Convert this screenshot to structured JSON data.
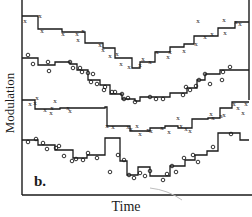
{
  "figure": {
    "panel_label": "b.",
    "xlabel": "Time",
    "ylabel": "Modulation"
  },
  "colors": {
    "ink": "#1a1a1a",
    "background": "#ffffff",
    "stray_mark": "#bdbdbd"
  },
  "chart_data": {
    "type": "line",
    "subtype": "step",
    "title": "",
    "panel": "b.",
    "xlabel": "Time",
    "ylabel": "Modulation",
    "grid": false,
    "legend": null,
    "ticks": "none labeled",
    "units": "pixel coordinates (arbitrary, no numeric axis labels shown)",
    "series": [
      {
        "name": "trace-1",
        "marker": "x",
        "step_points": [
          [
            22,
            16
          ],
          [
            38,
            16
          ],
          [
            38,
            29
          ],
          [
            62,
            29
          ],
          [
            62,
            32
          ],
          [
            85,
            32
          ],
          [
            85,
            43
          ],
          [
            103,
            43
          ],
          [
            103,
            48
          ],
          [
            115,
            48
          ],
          [
            115,
            58
          ],
          [
            132,
            58
          ],
          [
            132,
            68
          ],
          [
            140,
            68
          ],
          [
            140,
            62
          ],
          [
            155,
            62
          ],
          [
            155,
            52
          ],
          [
            170,
            52
          ],
          [
            170,
            47
          ],
          [
            184,
            47
          ],
          [
            184,
            44
          ],
          [
            194,
            44
          ],
          [
            194,
            36
          ],
          [
            218,
            36
          ],
          [
            218,
            28
          ],
          [
            235,
            28
          ],
          [
            235,
            22
          ],
          [
            249,
            22
          ]
        ],
        "markers": [
          [
            25,
            20
          ],
          [
            40,
            15
          ],
          [
            42,
            30
          ],
          [
            63,
            33
          ],
          [
            77,
            33
          ],
          [
            78,
            39
          ],
          [
            83,
            30
          ],
          [
            100,
            44
          ],
          [
            103,
            49
          ],
          [
            110,
            55
          ],
          [
            117,
            53
          ],
          [
            121,
            63
          ],
          [
            129,
            66
          ],
          [
            140,
            64
          ],
          [
            143,
            58
          ],
          [
            150,
            61
          ],
          [
            157,
            51
          ],
          [
            170,
            51
          ],
          [
            168,
            56
          ],
          [
            184,
            50
          ],
          [
            196,
            43
          ],
          [
            198,
            20
          ],
          [
            205,
            36
          ],
          [
            212,
            33
          ],
          [
            225,
            32
          ],
          [
            224,
            19
          ],
          [
            236,
            21
          ],
          [
            240,
            23
          ]
        ]
      },
      {
        "name": "trace-2",
        "marker": "o",
        "step_points": [
          [
            22,
            58
          ],
          [
            38,
            58
          ],
          [
            38,
            65
          ],
          [
            55,
            65
          ],
          [
            55,
            62
          ],
          [
            70,
            62
          ],
          [
            70,
            64
          ],
          [
            77,
            64
          ],
          [
            77,
            70
          ],
          [
            88,
            70
          ],
          [
            88,
            80
          ],
          [
            100,
            80
          ],
          [
            100,
            85
          ],
          [
            110,
            85
          ],
          [
            110,
            94
          ],
          [
            122,
            94
          ],
          [
            122,
            99
          ],
          [
            135,
            99
          ],
          [
            135,
            101
          ],
          [
            140,
            101
          ],
          [
            140,
            97
          ],
          [
            170,
            97
          ],
          [
            170,
            93
          ],
          [
            187,
            93
          ],
          [
            187,
            88
          ],
          [
            197,
            88
          ],
          [
            197,
            80
          ],
          [
            205,
            80
          ],
          [
            205,
            74
          ],
          [
            220,
            74
          ],
          [
            220,
            70
          ],
          [
            249,
            70
          ]
        ],
        "markers": [
          [
            28,
            55
          ],
          [
            33,
            64
          ],
          [
            48,
            62
          ],
          [
            49,
            71
          ],
          [
            70,
            62
          ],
          [
            73,
            68
          ],
          [
            80,
            68
          ],
          [
            82,
            72
          ],
          [
            88,
            73
          ],
          [
            93,
            74
          ],
          [
            91,
            82
          ],
          [
            97,
            84
          ],
          [
            104,
            90
          ],
          [
            105,
            87
          ],
          [
            112,
            92
          ],
          [
            115,
            92
          ],
          [
            122,
            94
          ],
          [
            124,
            99
          ],
          [
            128,
            98
          ],
          [
            135,
            102
          ],
          [
            150,
            97
          ],
          [
            156,
            99
          ],
          [
            163,
            99
          ],
          [
            183,
            95
          ],
          [
            186,
            87
          ],
          [
            190,
            90
          ],
          [
            196,
            86
          ],
          [
            199,
            80
          ],
          [
            205,
            74
          ],
          [
            210,
            84
          ],
          [
            222,
            80
          ],
          [
            223,
            72
          ],
          [
            230,
            67
          ]
        ]
      },
      {
        "name": "trace-3",
        "marker": "x",
        "step_points": [
          [
            22,
            100
          ],
          [
            35,
            100
          ],
          [
            35,
            109
          ],
          [
            60,
            109
          ],
          [
            60,
            108
          ],
          [
            105,
            108
          ],
          [
            105,
            107
          ],
          [
            107,
            107
          ],
          [
            107,
            126
          ],
          [
            130,
            126
          ],
          [
            130,
            131
          ],
          [
            150,
            131
          ],
          [
            150,
            128
          ],
          [
            165,
            128
          ],
          [
            165,
            126
          ],
          [
            178,
            126
          ],
          [
            178,
            128
          ],
          [
            192,
            128
          ],
          [
            192,
            119
          ],
          [
            208,
            119
          ],
          [
            208,
            118
          ],
          [
            220,
            118
          ],
          [
            220,
            108
          ],
          [
            232,
            108
          ],
          [
            232,
            102
          ],
          [
            249,
            102
          ]
        ],
        "markers": [
          [
            30,
            103
          ],
          [
            35,
            102
          ],
          [
            37,
            97
          ],
          [
            45,
            109
          ],
          [
            51,
            112
          ],
          [
            52,
            107
          ],
          [
            55,
            100
          ],
          [
            68,
            107
          ],
          [
            70,
            110
          ],
          [
            107,
            125
          ],
          [
            113,
            126
          ],
          [
            128,
            126
          ],
          [
            131,
            128
          ],
          [
            137,
            125
          ],
          [
            140,
            133
          ],
          [
            148,
            129
          ],
          [
            151,
            130
          ],
          [
            162,
            127
          ],
          [
            169,
            131
          ],
          [
            178,
            117
          ],
          [
            181,
            125
          ],
          [
            186,
            128
          ],
          [
            190,
            130
          ],
          [
            211,
            113
          ],
          [
            213,
            117
          ],
          [
            221,
            115
          ],
          [
            224,
            114
          ],
          [
            234,
            103
          ],
          [
            238,
            107
          ],
          [
            243,
            112
          ],
          [
            246,
            103
          ]
        ]
      },
      {
        "name": "trace-4",
        "marker": "o",
        "step_points": [
          [
            22,
            140
          ],
          [
            38,
            140
          ],
          [
            38,
            145
          ],
          [
            55,
            145
          ],
          [
            55,
            150
          ],
          [
            73,
            150
          ],
          [
            73,
            158
          ],
          [
            87,
            158
          ],
          [
            87,
            155
          ],
          [
            105,
            155
          ],
          [
            105,
            138
          ],
          [
            120,
            138
          ],
          [
            120,
            161
          ],
          [
            127,
            161
          ],
          [
            127,
            175
          ],
          [
            138,
            175
          ],
          [
            138,
            167
          ],
          [
            150,
            167
          ],
          [
            150,
            176
          ],
          [
            170,
            176
          ],
          [
            170,
            166
          ],
          [
            185,
            166
          ],
          [
            185,
            160
          ],
          [
            195,
            160
          ],
          [
            195,
            155
          ],
          [
            207,
            155
          ],
          [
            207,
            151
          ],
          [
            218,
            151
          ],
          [
            218,
            133
          ],
          [
            240,
            133
          ],
          [
            240,
            140
          ],
          [
            249,
            140
          ]
        ],
        "markers": [
          [
            28,
            142
          ],
          [
            36,
            139
          ],
          [
            43,
            143
          ],
          [
            47,
            149
          ],
          [
            56,
            148
          ],
          [
            59,
            146
          ],
          [
            64,
            156
          ],
          [
            72,
            161
          ],
          [
            76,
            159
          ],
          [
            83,
            160
          ],
          [
            88,
            153
          ],
          [
            97,
            158
          ],
          [
            110,
            172
          ],
          [
            118,
            155
          ],
          [
            124,
            160
          ],
          [
            129,
            175
          ],
          [
            134,
            178
          ],
          [
            140,
            173
          ],
          [
            145,
            176
          ],
          [
            150,
            171
          ],
          [
            163,
            180
          ],
          [
            167,
            174
          ],
          [
            172,
            166
          ],
          [
            176,
            172
          ],
          [
            184,
            158
          ],
          [
            193,
            155
          ],
          [
            198,
            162
          ],
          [
            213,
            147
          ],
          [
            231,
            134
          ]
        ]
      }
    ],
    "axes": {
      "left_x": 22,
      "right_x": 249,
      "top_y": 0,
      "bottom_y": 195
    }
  }
}
